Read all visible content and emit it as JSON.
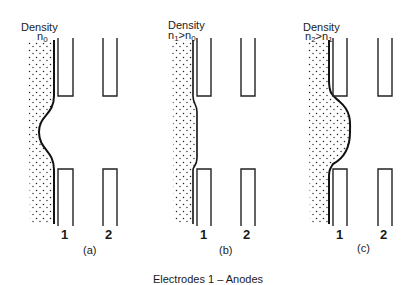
{
  "panels": [
    {
      "id": "a",
      "density_label": "Density",
      "density_expr": "n",
      "density_sub": "0",
      "density_rel": "",
      "density_rhs": "",
      "rhs_sub": "",
      "electrode_1": "1",
      "electrode_2": "2",
      "caption": "(a)",
      "boundary": "concave"
    },
    {
      "id": "b",
      "density_label": "Density",
      "density_expr": "n",
      "density_sub": "1",
      "density_rel": ">",
      "density_rhs": "n",
      "rhs_sub": "0",
      "electrode_1": "1",
      "electrode_2": "2",
      "caption": "(b)",
      "boundary": "flat"
    },
    {
      "id": "c",
      "density_label": "Density",
      "density_expr": "n",
      "density_sub": "2",
      "density_rel": ">",
      "density_rhs": "n",
      "rhs_sub": "1",
      "electrode_1": "1",
      "electrode_2": "2",
      "caption": "(c)",
      "boundary": "convex"
    }
  ],
  "footer": "Electrodes 1 – Anodes"
}
